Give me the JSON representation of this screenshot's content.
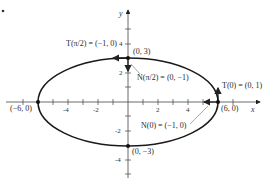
{
  "diagram": {
    "type": "ellipse-with-tangent-and-normal-vectors",
    "axes": {
      "x_label": "x",
      "y_label": "y",
      "x_ticks": [
        "-4",
        "-2",
        "2",
        "4"
      ],
      "y_ticks": [
        "4",
        "2",
        "-2",
        "-4"
      ]
    },
    "points": [
      {
        "id": "top",
        "label": "(0, 3)"
      },
      {
        "id": "bottom",
        "label": "(0, −3)"
      },
      {
        "id": "left",
        "label": "(−6, 0)"
      },
      {
        "id": "right",
        "label": "(6, 0)"
      }
    ],
    "vectors": {
      "T_pi2": "T(π/2) = (−1, 0)",
      "N_pi2": "N(π/2) = (0, −1)",
      "T0": "T(0) = (0, 1)",
      "N0": "N(0) = (−1, 0)"
    },
    "marker": "•"
  }
}
